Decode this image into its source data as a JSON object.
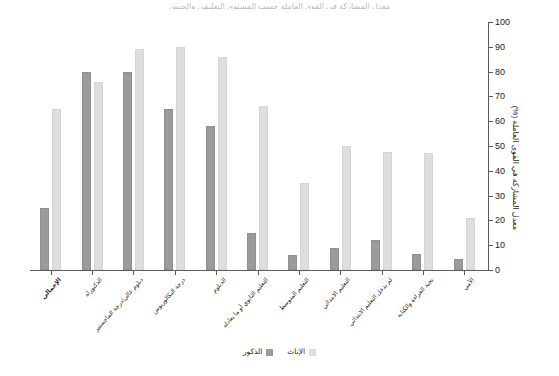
{
  "title": {
    "text": "معدل المشاركة في القوى العاملة حسب المستوى التعليمي والجنس"
  },
  "y_axis": {
    "title": "معدل المشاركة في القوى العاملة (%)",
    "ticks": [
      "0",
      "10",
      "20",
      "30",
      "40",
      "50",
      "60",
      "70",
      "80",
      "90",
      "100"
    ]
  },
  "legend": {
    "items": [
      {
        "label": "الذكور",
        "color": "#9b9b9b",
        "key": "male"
      },
      {
        "label": "الإناث",
        "color": "#dedede",
        "key": "female"
      }
    ]
  },
  "colors": {
    "male": "#9b9b9b",
    "female": "#dedede",
    "axis": "#5c5c5c",
    "text": "#1c1c1c",
    "background": "#ffffff"
  },
  "chart_data": {
    "type": "bar",
    "title": "معدل المشاركة في القوى العاملة حسب المستوى التعليمي والجنس",
    "xlabel": "",
    "ylabel": "معدل المشاركة في القوى العاملة (%)",
    "ylim": [
      0,
      100
    ],
    "ytick_step": 10,
    "grid": false,
    "legend_position": "bottom",
    "orientation": "rtl",
    "categories": [
      "الإجمالي",
      "الدكتوراه",
      "دبلوم عالي/درجة الماجستير",
      "درجة البكالوريوس",
      "الدبلوم",
      "التعليم الثانوي أو ما يعادله",
      "التعليم المتوسط",
      "التعليم الابتدائي",
      "لم يدخل التعليم الابتدائي",
      "يجيد القراءة والكتابة",
      "الأمي"
    ],
    "series": [
      {
        "name": "الذكور",
        "color": "#9b9b9b",
        "values": [
          25,
          80,
          80,
          65,
          58,
          15,
          6,
          9,
          12,
          6.5,
          4.5
        ]
      },
      {
        "name": "الإناث",
        "color": "#dedede",
        "values": [
          65,
          76,
          89,
          90,
          86,
          66,
          35,
          50,
          47.5,
          47,
          21
        ]
      }
    ]
  }
}
